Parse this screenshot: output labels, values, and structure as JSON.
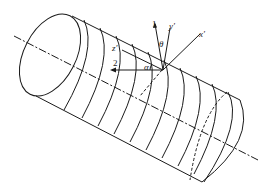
{
  "diagram": {
    "labels": {
      "axis1": "1",
      "axis2": "2",
      "x_prime": "x′",
      "y_prime": "y′",
      "z_prime": "z′",
      "angle_theta": "θ",
      "angle_alpha": "α"
    },
    "colors": {
      "line": "#1a1a1a",
      "background": "#ffffff"
    }
  }
}
